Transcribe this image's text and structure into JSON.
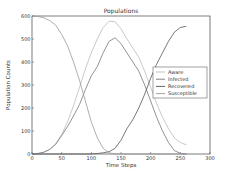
{
  "chart_data": {
    "type": "line",
    "title": "Populations",
    "xlabel": "Time Steps",
    "ylabel": "Population Counts",
    "xlim": [
      0,
      300
    ],
    "ylim": [
      0,
      600
    ],
    "xticks": [
      0,
      50,
      100,
      150,
      200,
      250,
      300
    ],
    "yticks": [
      0,
      100,
      200,
      300,
      400,
      500,
      600
    ],
    "grid": false,
    "legend_position": "center right",
    "x": [
      0,
      10,
      20,
      30,
      40,
      50,
      60,
      70,
      80,
      90,
      100,
      110,
      120,
      130,
      140,
      150,
      160,
      170,
      180,
      190,
      200,
      210,
      220,
      230,
      240,
      250,
      260
    ],
    "series": [
      {
        "name": "Aware",
        "color": "#bbbbbb",
        "values": [
          0,
          2,
          8,
          20,
          45,
          85,
          140,
          210,
          290,
          370,
          440,
          500,
          550,
          578,
          575,
          545,
          500,
          460,
          420,
          360,
          290,
          220,
          160,
          110,
          70,
          50,
          40
        ]
      },
      {
        "name": "Infected",
        "color": "#777777",
        "values": [
          0,
          2,
          8,
          20,
          42,
          80,
          120,
          165,
          215,
          280,
          340,
          380,
          440,
          490,
          505,
          480,
          440,
          400,
          360,
          300,
          230,
          160,
          100,
          50,
          15,
          3,
          0
        ]
      },
      {
        "name": "Recovered",
        "color": "#555555",
        "values": [
          0,
          0,
          0,
          0,
          0,
          0,
          0,
          0,
          0,
          0,
          0,
          2,
          5,
          10,
          25,
          60,
          110,
          150,
          200,
          260,
          330,
          390,
          440,
          490,
          530,
          550,
          555
        ]
      },
      {
        "name": "Susceptible",
        "color": "#999999",
        "values": [
          600,
          598,
          592,
          580,
          560,
          520,
          470,
          400,
          320,
          230,
          140,
          70,
          25,
          5,
          0,
          0,
          0,
          0,
          0,
          0,
          0,
          0,
          0,
          0,
          0,
          0,
          0
        ]
      }
    ]
  }
}
